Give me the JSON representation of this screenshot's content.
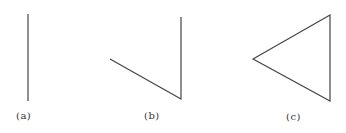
{
  "figures": [
    {
      "id": "a",
      "label": "(a)",
      "points": [
        [
          28,
          14
        ],
        [
          28,
          101
        ]
      ],
      "closed": false,
      "label_pos": [
        16,
        110
      ]
    },
    {
      "id": "b",
      "label": "(b)",
      "points": [
        [
          110,
          59
        ],
        [
          181,
          99
        ],
        [
          181,
          17
        ]
      ],
      "closed": false,
      "label_pos": [
        144,
        110
      ]
    },
    {
      "id": "c",
      "label": "(c)",
      "points": [
        [
          253,
          59
        ],
        [
          330,
          15
        ],
        [
          330,
          101
        ]
      ],
      "closed": true,
      "label_pos": [
        286,
        111
      ]
    }
  ],
  "stroke_color": "#444444",
  "stroke_width": 1.2
}
